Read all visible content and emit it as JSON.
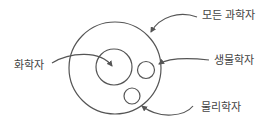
{
  "diagram": {
    "type": "venn-subset",
    "stroke_color": "#555555",
    "text_color": "#444444",
    "sets": [
      {
        "id": "all-scientists",
        "label": "모든 과학자",
        "cx": 115,
        "cy": 68,
        "r": 46
      },
      {
        "id": "chemists",
        "label": "화학자",
        "cx": 114,
        "cy": 67,
        "r": 18
      },
      {
        "id": "biologists",
        "label": "생물학자",
        "cx": 146,
        "cy": 70,
        "r": 8.5
      },
      {
        "id": "physicists",
        "label": "물리학자",
        "cx": 132,
        "cy": 96,
        "r": 8
      }
    ],
    "labels": {
      "all_scientists": "모든 과학자",
      "chemists": "화학자",
      "biologists": "생물학자",
      "physicists": "물리학자"
    }
  }
}
